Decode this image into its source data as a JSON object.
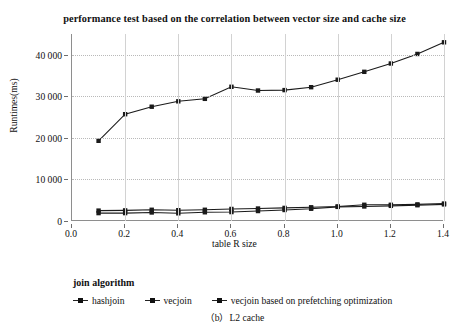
{
  "chart_data": {
    "type": "line",
    "title": "performance test based on the correlation between vector size and cache size",
    "subtitle": "（b）L2 cache",
    "xlabel": "table R size",
    "ylabel": "Runtimes(ms)",
    "xlim": [
      0.0,
      1.4
    ],
    "ylim": [
      0,
      45000
    ],
    "xticks": [
      "0.0",
      "0.2",
      "0.4",
      "0.6",
      "0.8",
      "1.0",
      "1.2",
      "1.4"
    ],
    "xtick_values": [
      0.0,
      0.2,
      0.4,
      0.6,
      0.8,
      1.0,
      1.2,
      1.4
    ],
    "yticks": [
      "0",
      "10 000",
      "20 000",
      "30 000",
      "40 000"
    ],
    "ytick_values": [
      0,
      10000,
      20000,
      30000,
      40000
    ],
    "grid": true,
    "legend_position": "below",
    "legend_title": "join algorithm",
    "x": [
      0.1,
      0.2,
      0.3,
      0.4,
      0.5,
      0.6,
      0.7,
      0.8,
      0.9,
      1.0,
      1.1,
      1.2,
      1.3,
      1.4
    ],
    "series": [
      {
        "name": "hashjoin",
        "color": "#1a1a1a",
        "marker": "square",
        "values": [
          19300,
          25700,
          27500,
          28800,
          29400,
          32300,
          31400,
          31500,
          32200,
          34000,
          35900,
          37900,
          40200,
          43000
        ]
      },
      {
        "name": "vecjoin",
        "color": "#1a1a1a",
        "marker": "square",
        "values": [
          2500,
          2550,
          2700,
          2600,
          2700,
          2900,
          3000,
          3150,
          3300,
          3500,
          3900,
          3900,
          4000,
          4200
        ]
      },
      {
        "name": "vecjoin based on prefetching optimization",
        "color": "#1a1a1a",
        "marker": "square",
        "values": [
          1900,
          1900,
          2050,
          1850,
          2100,
          2150,
          2400,
          2650,
          2950,
          3400,
          3500,
          3650,
          3800,
          4000
        ]
      }
    ]
  },
  "legend": {
    "title": "join algorithm",
    "items": [
      {
        "label": "hashjoin"
      },
      {
        "label": "vecjoin"
      },
      {
        "label": "vecjoin based on prefetching optimization"
      }
    ]
  },
  "caption": "（b）L2 cache"
}
